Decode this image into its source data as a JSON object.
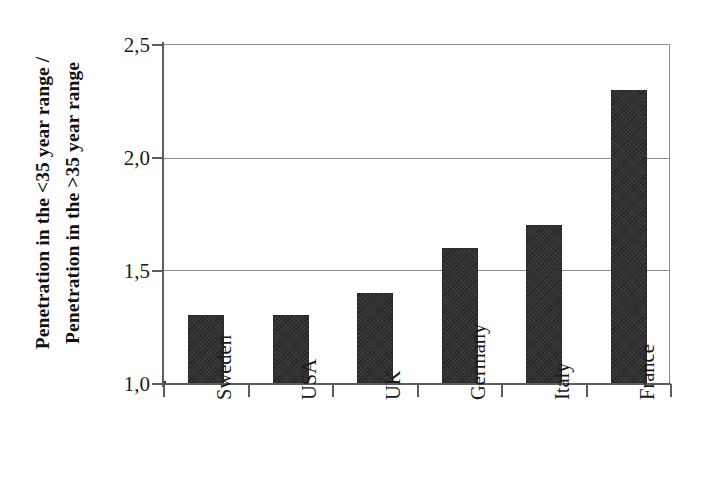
{
  "chart_data": {
    "type": "bar",
    "title": "",
    "subtitle": "",
    "xlabel": "",
    "ylabel": "Penetration in the <35 year range / Penetration in the >35 year range",
    "ylabel_lines": [
      "Penetration in the <35 year range /",
      "Penetration in the >35 year range"
    ],
    "categories": [
      "Sweden",
      "USA",
      "UK",
      "Germany",
      "Italy",
      "France"
    ],
    "values": [
      1.3,
      1.3,
      1.4,
      1.6,
      1.7,
      2.3
    ],
    "ylim": [
      1.0,
      2.5
    ],
    "ytick_values": [
      1.0,
      1.5,
      2.0,
      2.5
    ],
    "ytick_labels": [
      "1,0",
      "1,5",
      "2,0",
      "2,5"
    ],
    "grid": true,
    "grid_axis": "y",
    "legend": false,
    "legend_position": "none",
    "bar_color": "#333333",
    "axis_color": "#5d5d5d",
    "grid_color": "#8a8a8a",
    "background_color": "#ffffff",
    "decimal_separator": ","
  }
}
